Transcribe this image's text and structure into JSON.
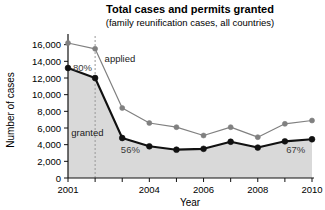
{
  "chart_data": {
    "type": "line",
    "title": "Total cases and permits granted",
    "subtitle": "(family reunification cases, all countries)",
    "xlabel": "Year",
    "ylabel": "Number of cases",
    "x": [
      2001,
      2002,
      2003,
      2004,
      2005,
      2006,
      2007,
      2008,
      2009,
      2010
    ],
    "categories": [
      "2001",
      "2002",
      "2003",
      "2004",
      "2005",
      "2006",
      "2007",
      "2008",
      "2009",
      "2010"
    ],
    "xtick_labels": [
      "2001",
      "",
      "",
      "2004",
      "",
      "2006",
      "",
      "2008",
      "",
      "2010"
    ],
    "ytick_labels": [
      "0",
      "2,000",
      "4,000",
      "6,000",
      "8,000",
      "10,000",
      "12,000",
      "14,000",
      "16,000"
    ],
    "ytick_values": [
      0,
      2000,
      4000,
      6000,
      8000,
      10000,
      12000,
      14000,
      16000
    ],
    "ylim": [
      0,
      16800
    ],
    "xlim": [
      2001,
      2010
    ],
    "grid": false,
    "legend": "inline-labels",
    "series": [
      {
        "name": "applied",
        "label": "applied",
        "color": "#808080",
        "marker": "circle",
        "values": [
          16200,
          15500,
          8400,
          6600,
          6100,
          5100,
          6100,
          4900,
          6500,
          6900
        ]
      },
      {
        "name": "granted",
        "label": "granted",
        "color": "#111111",
        "marker": "circle-filled",
        "fill": "#d9d9d9",
        "values": [
          13200,
          12000,
          4800,
          3800,
          3400,
          3500,
          4350,
          3650,
          4400,
          4650
        ]
      }
    ],
    "annotations": [
      {
        "name": "ratio-2001",
        "text": "80%",
        "x": 2001,
        "y": 13200
      },
      {
        "name": "ratio-2003",
        "text": "56%",
        "x": 2003,
        "y": 4800
      },
      {
        "name": "ratio-2010",
        "text": "67%",
        "x": 2010,
        "y": 4650
      }
    ],
    "reference_line": {
      "name": "dashed-marker-2002",
      "x": 2002,
      "style": "dashed",
      "color": "#999999"
    }
  }
}
